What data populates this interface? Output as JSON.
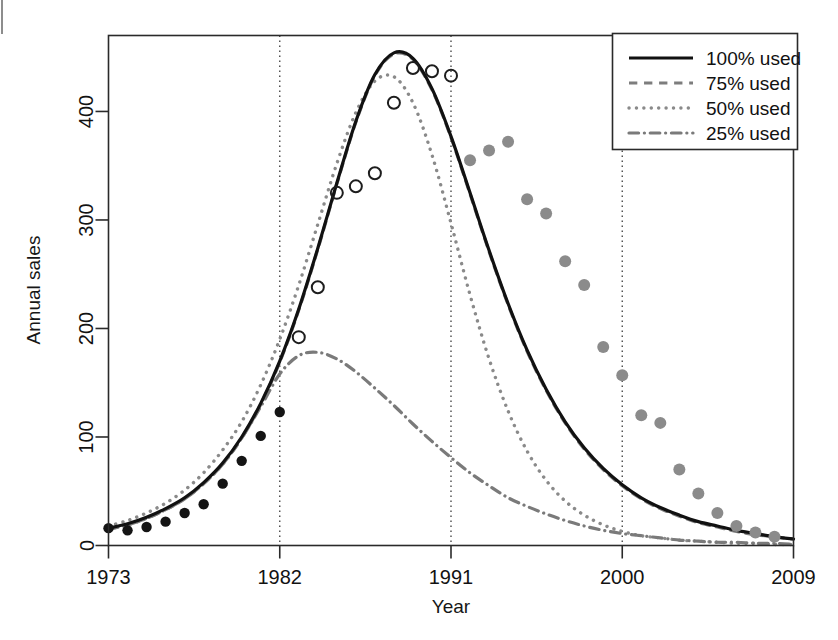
{
  "chart_data": {
    "type": "line",
    "title": "",
    "xlabel": "Year",
    "ylabel": "Annual sales",
    "xlim": [
      1973,
      2009
    ],
    "ylim": [
      0,
      470
    ],
    "xticks": [
      1973,
      1982,
      1991,
      2000,
      2009
    ],
    "yticks": [
      0,
      100,
      200,
      300,
      400
    ],
    "xtick_labels": [
      "1973",
      "1982",
      "1991",
      "2000",
      "2009"
    ],
    "ytick_labels": [
      "0",
      "100",
      "200",
      "300",
      "400"
    ],
    "grid": "vertical dotted at 1982, 1991, 2000",
    "gridlines_x": [
      1982,
      1991,
      2000
    ],
    "legend_position": "top-right",
    "series": [
      {
        "name": "100% used",
        "style": "solid",
        "color": "#111111",
        "width": 3.2,
        "x": [
          1973,
          1974,
          1975,
          1976,
          1977,
          1978,
          1979,
          1980,
          1981,
          1982,
          1983,
          1984,
          1985,
          1986,
          1987,
          1988,
          1989,
          1990,
          1991,
          1992,
          1993,
          1994,
          1995,
          1996,
          1997,
          1998,
          1999,
          2000,
          2001,
          2002,
          2003,
          2004,
          2005,
          2006,
          2007,
          2008,
          2009
        ],
        "values": [
          16,
          20,
          26,
          34,
          44,
          58,
          76,
          100,
          131,
          170,
          218,
          274,
          334,
          391,
          434,
          454,
          449,
          421,
          377,
          325,
          272,
          223,
          180,
          144,
          114,
          90,
          71,
          56,
          44,
          35,
          28,
          22,
          18,
          14,
          11,
          8,
          6
        ]
      },
      {
        "name": "75% used",
        "style": "dashed",
        "color": "#7d7d7d",
        "width": 3.2,
        "x": [
          1973,
          1974,
          1975,
          1976,
          1977,
          1978,
          1979,
          1980,
          1981,
          1982,
          1983,
          1984,
          1985,
          1986,
          1987,
          1988,
          1989,
          1990,
          1991,
          1992,
          1993,
          1994,
          1995,
          1996,
          1997,
          1998,
          1999,
          2000,
          2001,
          2002,
          2003,
          2004,
          2005,
          2006,
          2007,
          2008,
          2009
        ],
        "values": [
          15,
          19,
          25,
          33,
          43,
          57,
          75,
          99,
          130,
          169,
          217,
          273,
          333,
          390,
          433,
          453,
          448,
          420,
          376,
          324,
          271,
          222,
          179,
          143,
          113,
          89,
          70,
          55,
          43,
          34,
          27,
          21,
          17,
          13,
          10,
          8,
          6
        ]
      },
      {
        "name": "50% used",
        "style": "dotted",
        "color": "#8a8a8a",
        "width": 3.4,
        "x": [
          1973,
          1974,
          1975,
          1976,
          1977,
          1978,
          1979,
          1980,
          1981,
          1982,
          1983,
          1984,
          1985,
          1986,
          1987,
          1988,
          1989,
          1990,
          1991,
          1992,
          1993,
          1994,
          1995,
          1996,
          1997,
          1998,
          1999,
          2000,
          2001,
          2002,
          2003,
          2004,
          2005,
          2006,
          2007,
          2008,
          2009
        ],
        "values": [
          18,
          23,
          30,
          39,
          51,
          67,
          88,
          114,
          148,
          190,
          240,
          296,
          352,
          399,
          428,
          432,
          408,
          360,
          297,
          231,
          172,
          124,
          87,
          60,
          41,
          28,
          19,
          13,
          9,
          7,
          5,
          4,
          3,
          2,
          2,
          1,
          1
        ]
      },
      {
        "name": "25% used",
        "style": "dashdot",
        "color": "#7a7a7a",
        "width": 3.2,
        "x": [
          1973,
          1974,
          1975,
          1976,
          1977,
          1978,
          1979,
          1980,
          1981,
          1982,
          1983,
          1984,
          1985,
          1986,
          1987,
          1988,
          1989,
          1990,
          1991,
          1992,
          1993,
          1994,
          1995,
          1996,
          1997,
          1998,
          1999,
          2000,
          2001,
          2002,
          2003,
          2004,
          2005,
          2006,
          2007,
          2008,
          2009
        ],
        "values": [
          15,
          19,
          25,
          33,
          43,
          57,
          75,
          99,
          128,
          158,
          175,
          178,
          172,
          160,
          145,
          129,
          112,
          96,
          81,
          67,
          55,
          44,
          36,
          29,
          23,
          18,
          14,
          11,
          9,
          7,
          5,
          4,
          3,
          3,
          2,
          2,
          1
        ]
      }
    ],
    "scatter": [
      {
        "name": "observed-early",
        "marker": "filled-dark",
        "color": "#141414",
        "size": 5.2,
        "points": [
          [
            1973,
            16
          ],
          [
            1974,
            14
          ],
          [
            1975,
            17
          ],
          [
            1976,
            22
          ],
          [
            1977,
            30
          ],
          [
            1978,
            38
          ],
          [
            1979,
            57
          ],
          [
            1980,
            78
          ],
          [
            1981,
            101
          ],
          [
            1982,
            123
          ]
        ]
      },
      {
        "name": "observed-peak",
        "marker": "open-circle",
        "color": "#1d1d1d",
        "size": 6.0,
        "points": [
          [
            1983,
            192
          ],
          [
            1984,
            238
          ],
          [
            1985,
            325
          ],
          [
            1986,
            331
          ],
          [
            1987,
            343
          ],
          [
            1988,
            408
          ],
          [
            1989,
            440
          ],
          [
            1990,
            437
          ],
          [
            1991,
            433
          ]
        ]
      },
      {
        "name": "observed-late",
        "marker": "filled-gray",
        "color": "#8b8b8b",
        "size": 6.0,
        "points": [
          [
            1992,
            355
          ],
          [
            1993,
            364
          ],
          [
            1994,
            372
          ],
          [
            1995,
            319
          ],
          [
            1996,
            306
          ],
          [
            1997,
            262
          ],
          [
            1998,
            240
          ],
          [
            1999,
            183
          ],
          [
            2000,
            157
          ],
          [
            2001,
            120
          ],
          [
            2002,
            113
          ],
          [
            2003,
            70
          ],
          [
            2004,
            48
          ],
          [
            2005,
            30
          ],
          [
            2006,
            18
          ],
          [
            2007,
            12
          ],
          [
            2008,
            8
          ]
        ]
      }
    ]
  },
  "legend": {
    "items": [
      {
        "label": "100% used",
        "style": "solid",
        "color": "#111111"
      },
      {
        "label": "75% used",
        "style": "dashed",
        "color": "#7d7d7d"
      },
      {
        "label": "50% used",
        "style": "dotted",
        "color": "#8a8a8a"
      },
      {
        "label": "25% used",
        "style": "dashdot",
        "color": "#7a7a7a"
      }
    ]
  },
  "axes": {
    "x_title": "Year",
    "y_title": "Annual sales"
  }
}
